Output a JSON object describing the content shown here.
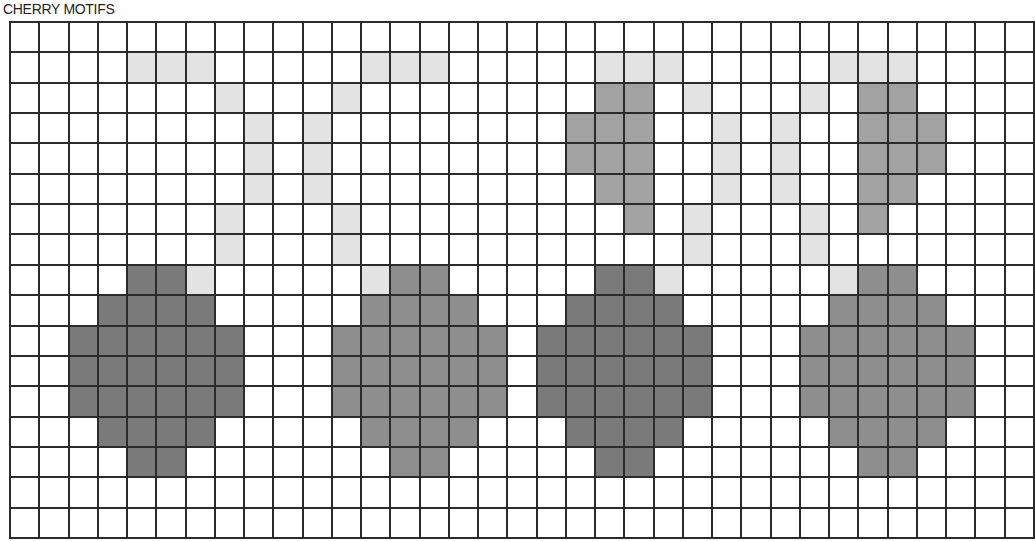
{
  "title": "CHERRY MOTIFS",
  "grid": {
    "columns": 35,
    "rows": 17,
    "colors": {
      "empty": "#ffffff",
      "stem": "#e3e3e3",
      "leaf": "#a2a2a2",
      "dark": "#7a7a7a",
      "med": "#8e8e8e",
      "line": "#2b2b2b"
    },
    "cells": [
      {
        "r": 1,
        "c": [
          4,
          5,
          6,
          12,
          13,
          14,
          20,
          21,
          22,
          28,
          29,
          30
        ],
        "t": "stem"
      },
      {
        "r": 2,
        "c": [
          7,
          11,
          23,
          27
        ],
        "t": "stem"
      },
      {
        "r": 2,
        "c": [
          20,
          21,
          29,
          30
        ],
        "t": "leaf"
      },
      {
        "r": 3,
        "c": [
          8,
          10,
          24,
          26
        ],
        "t": "stem"
      },
      {
        "r": 3,
        "c": [
          19,
          20,
          21,
          29,
          30,
          31
        ],
        "t": "leaf"
      },
      {
        "r": 4,
        "c": [
          8,
          10,
          24,
          26
        ],
        "t": "stem"
      },
      {
        "r": 4,
        "c": [
          19,
          20,
          21,
          29,
          30,
          31
        ],
        "t": "leaf"
      },
      {
        "r": 5,
        "c": [
          8,
          10,
          24,
          26
        ],
        "t": "stem"
      },
      {
        "r": 5,
        "c": [
          20,
          21,
          29,
          30
        ],
        "t": "leaf"
      },
      {
        "r": 6,
        "c": [
          7,
          11,
          23,
          27
        ],
        "t": "stem"
      },
      {
        "r": 6,
        "c": [
          21,
          29
        ],
        "t": "leaf"
      },
      {
        "r": 7,
        "c": [
          7,
          11,
          23,
          27
        ],
        "t": "stem"
      },
      {
        "r": 8,
        "c": [
          6,
          12,
          22,
          28
        ],
        "t": "stem"
      },
      {
        "r": 8,
        "c": [
          4,
          5,
          20,
          21
        ],
        "t": "dark"
      },
      {
        "r": 8,
        "c": [
          13,
          14,
          29,
          30
        ],
        "t": "med"
      },
      {
        "r": 9,
        "c": [
          3,
          4,
          5,
          6,
          19,
          20,
          21,
          22
        ],
        "t": "dark"
      },
      {
        "r": 9,
        "c": [
          12,
          13,
          14,
          15,
          28,
          29,
          30,
          31
        ],
        "t": "med"
      },
      {
        "r": 10,
        "c": [
          2,
          3,
          4,
          5,
          6,
          7,
          18,
          19,
          20,
          21,
          22,
          23
        ],
        "t": "dark"
      },
      {
        "r": 10,
        "c": [
          11,
          12,
          13,
          14,
          15,
          16,
          27,
          28,
          29,
          30,
          31,
          32
        ],
        "t": "med"
      },
      {
        "r": 11,
        "c": [
          2,
          3,
          4,
          5,
          6,
          7,
          18,
          19,
          20,
          21,
          22,
          23
        ],
        "t": "dark"
      },
      {
        "r": 11,
        "c": [
          11,
          12,
          13,
          14,
          15,
          16,
          27,
          28,
          29,
          30,
          31,
          32
        ],
        "t": "med"
      },
      {
        "r": 12,
        "c": [
          2,
          3,
          4,
          5,
          6,
          7,
          18,
          19,
          20,
          21,
          22,
          23
        ],
        "t": "dark"
      },
      {
        "r": 12,
        "c": [
          11,
          12,
          13,
          14,
          15,
          16,
          27,
          28,
          29,
          30,
          31,
          32
        ],
        "t": "med"
      },
      {
        "r": 13,
        "c": [
          3,
          4,
          5,
          6,
          19,
          20,
          21,
          22
        ],
        "t": "dark"
      },
      {
        "r": 13,
        "c": [
          12,
          13,
          14,
          15,
          28,
          29,
          30,
          31
        ],
        "t": "med"
      },
      {
        "r": 14,
        "c": [
          4,
          5,
          20,
          21
        ],
        "t": "dark"
      },
      {
        "r": 14,
        "c": [
          13,
          14,
          29,
          30
        ],
        "t": "med"
      }
    ]
  },
  "motifs": [
    {
      "name": "cherry-1",
      "shade": "dark"
    },
    {
      "name": "cherry-2",
      "shade": "med"
    },
    {
      "name": "cherry-3",
      "shade": "dark",
      "leaf": true
    },
    {
      "name": "cherry-4",
      "shade": "med",
      "leaf": true
    }
  ]
}
